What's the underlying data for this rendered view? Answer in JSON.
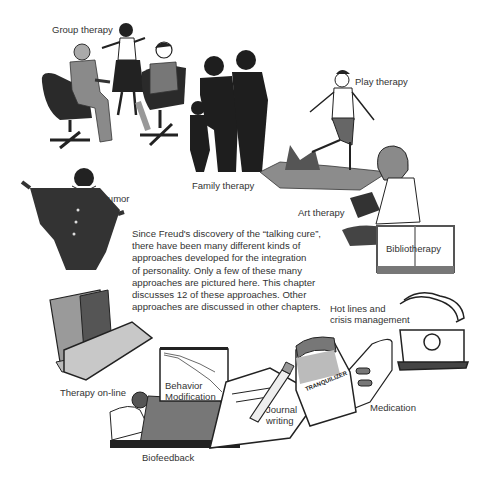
{
  "figure": {
    "description_paragraph": [
      "Since Freud's discovery of the “talking cure”,",
      "there have been many different kinds of",
      "approaches developed for the integration",
      "of personality. Only a few of these many",
      "approaches are pictured here. This chapter",
      "discusses 12 of these approaches. Other",
      "approaches are discussed in other chapters."
    ],
    "labels": {
      "group_therapy": "Group therapy",
      "play_therapy": "Play therapy",
      "family_therapy": "Family therapy",
      "art_therapy": "Art therapy",
      "humor": "Humor",
      "bibliotherapy": "Bibliotherapy",
      "hot_lines_line1": "Hot lines and",
      "hot_lines_line2": "crisis management",
      "therapy_online": "Therapy on-line",
      "behavior_mod_line1": "Behavior",
      "behavior_mod_line2": "Modification",
      "journal_line1": "Journal",
      "journal_line2": "writing",
      "medication": "Medication",
      "biofeedback": "Biofeedback",
      "bottle_label": "TRANQUILIZER"
    }
  }
}
